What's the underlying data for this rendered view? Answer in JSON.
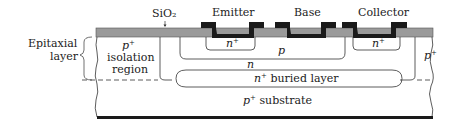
{
  "diagram": {
    "type": "cross-section",
    "colors": {
      "oxide": "#9a9a9a",
      "metal": "#1a1a1a",
      "line": "#333333",
      "background": "#ffffff"
    },
    "labels": {
      "sio2": "SiO₂",
      "emitter": "Emitter",
      "base": "Base",
      "collector": "Collector",
      "epitaxial_line1": "Epitaxial",
      "epitaxial_line2": "layer",
      "isolation_p": "p",
      "isolation_sup": "+",
      "isolation_line1": "isolation",
      "isolation_line2": "region",
      "emitter_region": "n",
      "emitter_region_sup": "+",
      "base_region": "p",
      "collector_region": "n",
      "collector_contact": "n",
      "collector_contact_sup": "+",
      "right_isolation": "p",
      "right_isolation_sup": "+",
      "buried_layer_n": "n",
      "buried_layer_sup": "+",
      "buried_layer_text": " buried layer",
      "substrate_p": "p",
      "substrate_sup": "+",
      "substrate_text": " substrate"
    }
  }
}
